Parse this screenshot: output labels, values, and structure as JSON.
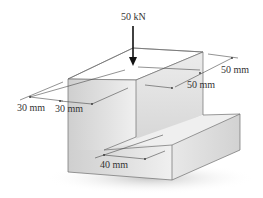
{
  "figure": {
    "type": "engineering-diagram"
  },
  "load": {
    "label": "50 kN",
    "direction": "downward"
  },
  "dimensions": [
    {
      "id": "left-outer",
      "label": "30 mm"
    },
    {
      "id": "left-inner",
      "label": "30 mm"
    },
    {
      "id": "right-outer",
      "label": "50 mm"
    },
    {
      "id": "right-inner",
      "label": "50 mm"
    },
    {
      "id": "step-width",
      "label": "40 mm"
    }
  ],
  "colors": {
    "background": "#ffffff",
    "top_face": "#eeeeee",
    "front_face": "#d9d9d9",
    "side_face": "#e4e4e4",
    "edge": "#6e6e6e",
    "arrow": "#111111",
    "text": "#333333",
    "shadow": "#bdbdbd"
  }
}
